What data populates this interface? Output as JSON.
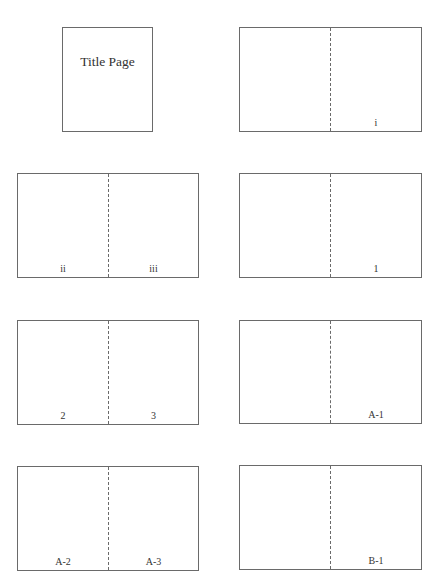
{
  "diagram": {
    "title_page": {
      "label": "Title Page"
    },
    "spreads": [
      {
        "left": "",
        "right": "i"
      },
      {
        "left": "ii",
        "right": "iii"
      },
      {
        "left": "",
        "right": "1"
      },
      {
        "left": "2",
        "right": "3"
      },
      {
        "left": "",
        "right": "A-1"
      },
      {
        "left": "A-2",
        "right": "A-3"
      },
      {
        "left": "",
        "right": "B-1"
      }
    ]
  }
}
